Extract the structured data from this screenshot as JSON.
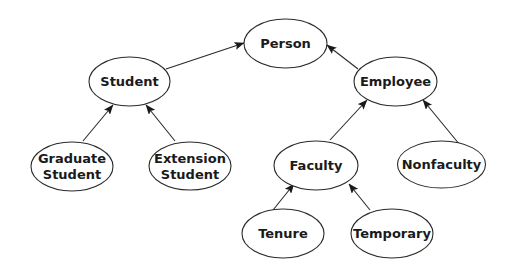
{
  "diagram": {
    "type": "class-hierarchy",
    "nodes": [
      {
        "id": "person",
        "lines": [
          "Person"
        ],
        "cx": 285.5,
        "cy": 43.5,
        "rx": 41.5,
        "ry": 24.5
      },
      {
        "id": "student",
        "lines": [
          "Student"
        ],
        "cx": 129.5,
        "cy": 81.5,
        "rx": 40.5,
        "ry": 24.5
      },
      {
        "id": "employee",
        "lines": [
          "Employee"
        ],
        "cx": 395.5,
        "cy": 81.5,
        "rx": 41.5,
        "ry": 24.5
      },
      {
        "id": "graduate-student",
        "lines": [
          "Graduate",
          "Student"
        ],
        "cx": 72,
        "cy": 166.5,
        "rx": 41,
        "ry": 24.5
      },
      {
        "id": "extension-student",
        "lines": [
          "Extension",
          "Student"
        ],
        "cx": 190,
        "cy": 166,
        "rx": 41,
        "ry": 24
      },
      {
        "id": "faculty",
        "lines": [
          "Faculty"
        ],
        "cx": 316,
        "cy": 165.5,
        "rx": 42,
        "ry": 24.5
      },
      {
        "id": "nonfaculty",
        "lines": [
          "Nonfaculty"
        ],
        "cx": 441.5,
        "cy": 164.5,
        "rx": 44,
        "ry": 23.5
      },
      {
        "id": "tenure",
        "lines": [
          "Tenure"
        ],
        "cx": 283,
        "cy": 233.5,
        "rx": 41,
        "ry": 24.5
      },
      {
        "id": "temporary",
        "lines": [
          "Temporary"
        ],
        "cx": 392,
        "cy": 233.5,
        "rx": 41,
        "ry": 24.5
      }
    ],
    "edges": [
      {
        "from": "student",
        "to": "person",
        "x1": 166,
        "y1": 69,
        "x2": 244,
        "y2": 43
      },
      {
        "from": "employee",
        "to": "person",
        "x1": 358,
        "y1": 69,
        "x2": 327,
        "y2": 45
      },
      {
        "from": "graduate-student",
        "to": "student",
        "x1": 83,
        "y1": 141,
        "x2": 113,
        "y2": 105
      },
      {
        "from": "extension-student",
        "to": "student",
        "x1": 175,
        "y1": 141,
        "x2": 146,
        "y2": 105
      },
      {
        "from": "faculty",
        "to": "employee",
        "x1": 330,
        "y1": 140,
        "x2": 367,
        "y2": 100
      },
      {
        "from": "nonfaculty",
        "to": "employee",
        "x1": 460,
        "y1": 145,
        "x2": 423,
        "y2": 100
      },
      {
        "from": "tenure",
        "to": "faculty",
        "x1": 273,
        "y1": 210,
        "x2": 294,
        "y2": 184
      },
      {
        "from": "temporary",
        "to": "faculty",
        "x1": 370,
        "y1": 210,
        "x2": 349,
        "y2": 184
      }
    ],
    "style": {
      "stroke": "#2a2a2a",
      "fill": "#ffffff",
      "text": "#1a1a1a",
      "background": "#ffffff"
    }
  }
}
